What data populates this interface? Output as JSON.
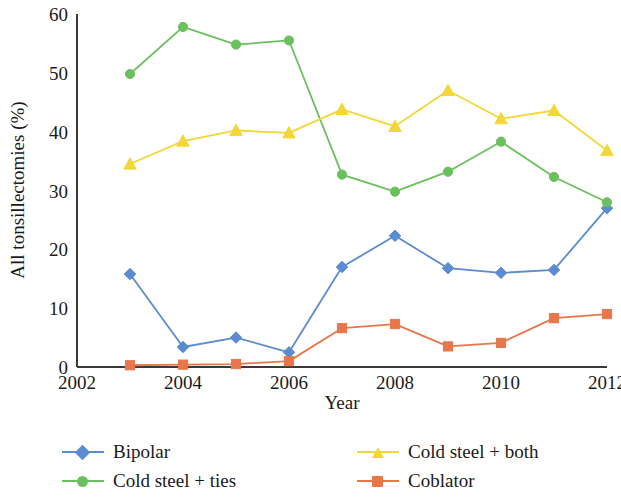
{
  "chart_data": {
    "type": "line",
    "title": "",
    "xlabel": "Year",
    "ylabel": "All tonsillectomies (%)",
    "x": [
      2003,
      2004,
      2005,
      2006,
      2007,
      2008,
      2009,
      2010,
      2011,
      2012
    ],
    "xlim": [
      2002,
      2012
    ],
    "ylim": [
      0,
      60
    ],
    "xticks": [
      2002,
      2004,
      2006,
      2008,
      2010,
      2012
    ],
    "xtick_labels": [
      "2002",
      "2004",
      "2006",
      "2008",
      "2010",
      "2012"
    ],
    "yticks": [
      0,
      10,
      20,
      30,
      40,
      50,
      60
    ],
    "ytick_labels": [
      "0",
      "10",
      "20",
      "30",
      "40",
      "50",
      "60"
    ],
    "grid": false,
    "legend_position": "bottom",
    "series": [
      {
        "name": "Bipolar",
        "color": "#5b8bd0",
        "marker": "diamond",
        "values": [
          15.8,
          3.4,
          5.0,
          2.5,
          17.0,
          22.3,
          16.8,
          16.0,
          16.5,
          27.0
        ]
      },
      {
        "name": "Cold steel + ties",
        "color": "#6cbf5e",
        "marker": "circle",
        "values": [
          49.8,
          57.8,
          54.8,
          55.5,
          32.7,
          29.8,
          33.2,
          38.3,
          32.3,
          28.0
        ]
      },
      {
        "name": "Cold steel + both",
        "color": "#f2d737",
        "marker": "triangle",
        "values": [
          34.5,
          38.4,
          40.2,
          39.8,
          43.8,
          40.9,
          47.0,
          42.2,
          43.6,
          36.8
        ]
      },
      {
        "name": "Coblator",
        "color": "#e8764a",
        "marker": "square",
        "values": [
          0.3,
          0.4,
          0.5,
          1.0,
          6.6,
          7.3,
          3.5,
          4.1,
          8.3,
          9.0
        ]
      }
    ]
  },
  "legend": {
    "entries": [
      {
        "label": "Bipolar",
        "color": "#5b8bd0",
        "marker": "diamond"
      },
      {
        "label": "Cold steel + both",
        "color": "#f2d737",
        "marker": "triangle"
      },
      {
        "label": "Cold steel + ties",
        "color": "#6cbf5e",
        "marker": "circle"
      },
      {
        "label": "Coblator",
        "color": "#e8764a",
        "marker": "square"
      }
    ]
  },
  "axes": {
    "y_title": "All tonsillectomies (%)",
    "x_title": "Year"
  }
}
